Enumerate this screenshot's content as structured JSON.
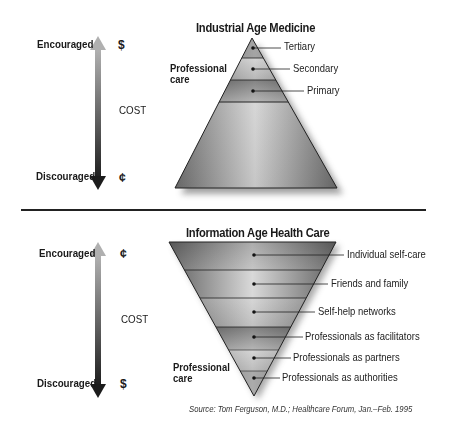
{
  "top_section": {
    "title": "Industrial Age Medicine",
    "axis": {
      "top_label": "Encouraged",
      "top_symbol": "$",
      "middle_label": "COST",
      "bottom_label": "Discouraged",
      "bottom_symbol": "¢"
    },
    "group_label_line1": "Professional",
    "group_label_line2": "care",
    "levels": [
      {
        "label": "Tertiary"
      },
      {
        "label": "Secondary"
      },
      {
        "label": "Primary"
      }
    ]
  },
  "bottom_section": {
    "title": "Information Age Health Care",
    "axis": {
      "top_label": "Encouraged",
      "top_symbol": "¢",
      "middle_label": "COST",
      "bottom_label": "Discouraged",
      "bottom_symbol": "$"
    },
    "group_label_line1": "Professional",
    "group_label_line2": "care",
    "levels": [
      {
        "label": "Individual self-care"
      },
      {
        "label": "Friends and family"
      },
      {
        "label": "Self-help networks"
      },
      {
        "label": "Professionals as facilitators"
      },
      {
        "label": "Professionals as partners"
      },
      {
        "label": "Professionals as authorities"
      }
    ]
  },
  "source": "Source: Tom Ferguson, M.D.; Healthcare Forum, Jan.–Feb. 1995",
  "colors": {
    "ink": "#1a1a1a",
    "band_dark": "#4a4a4a",
    "band_light": "#d8d8d8"
  }
}
